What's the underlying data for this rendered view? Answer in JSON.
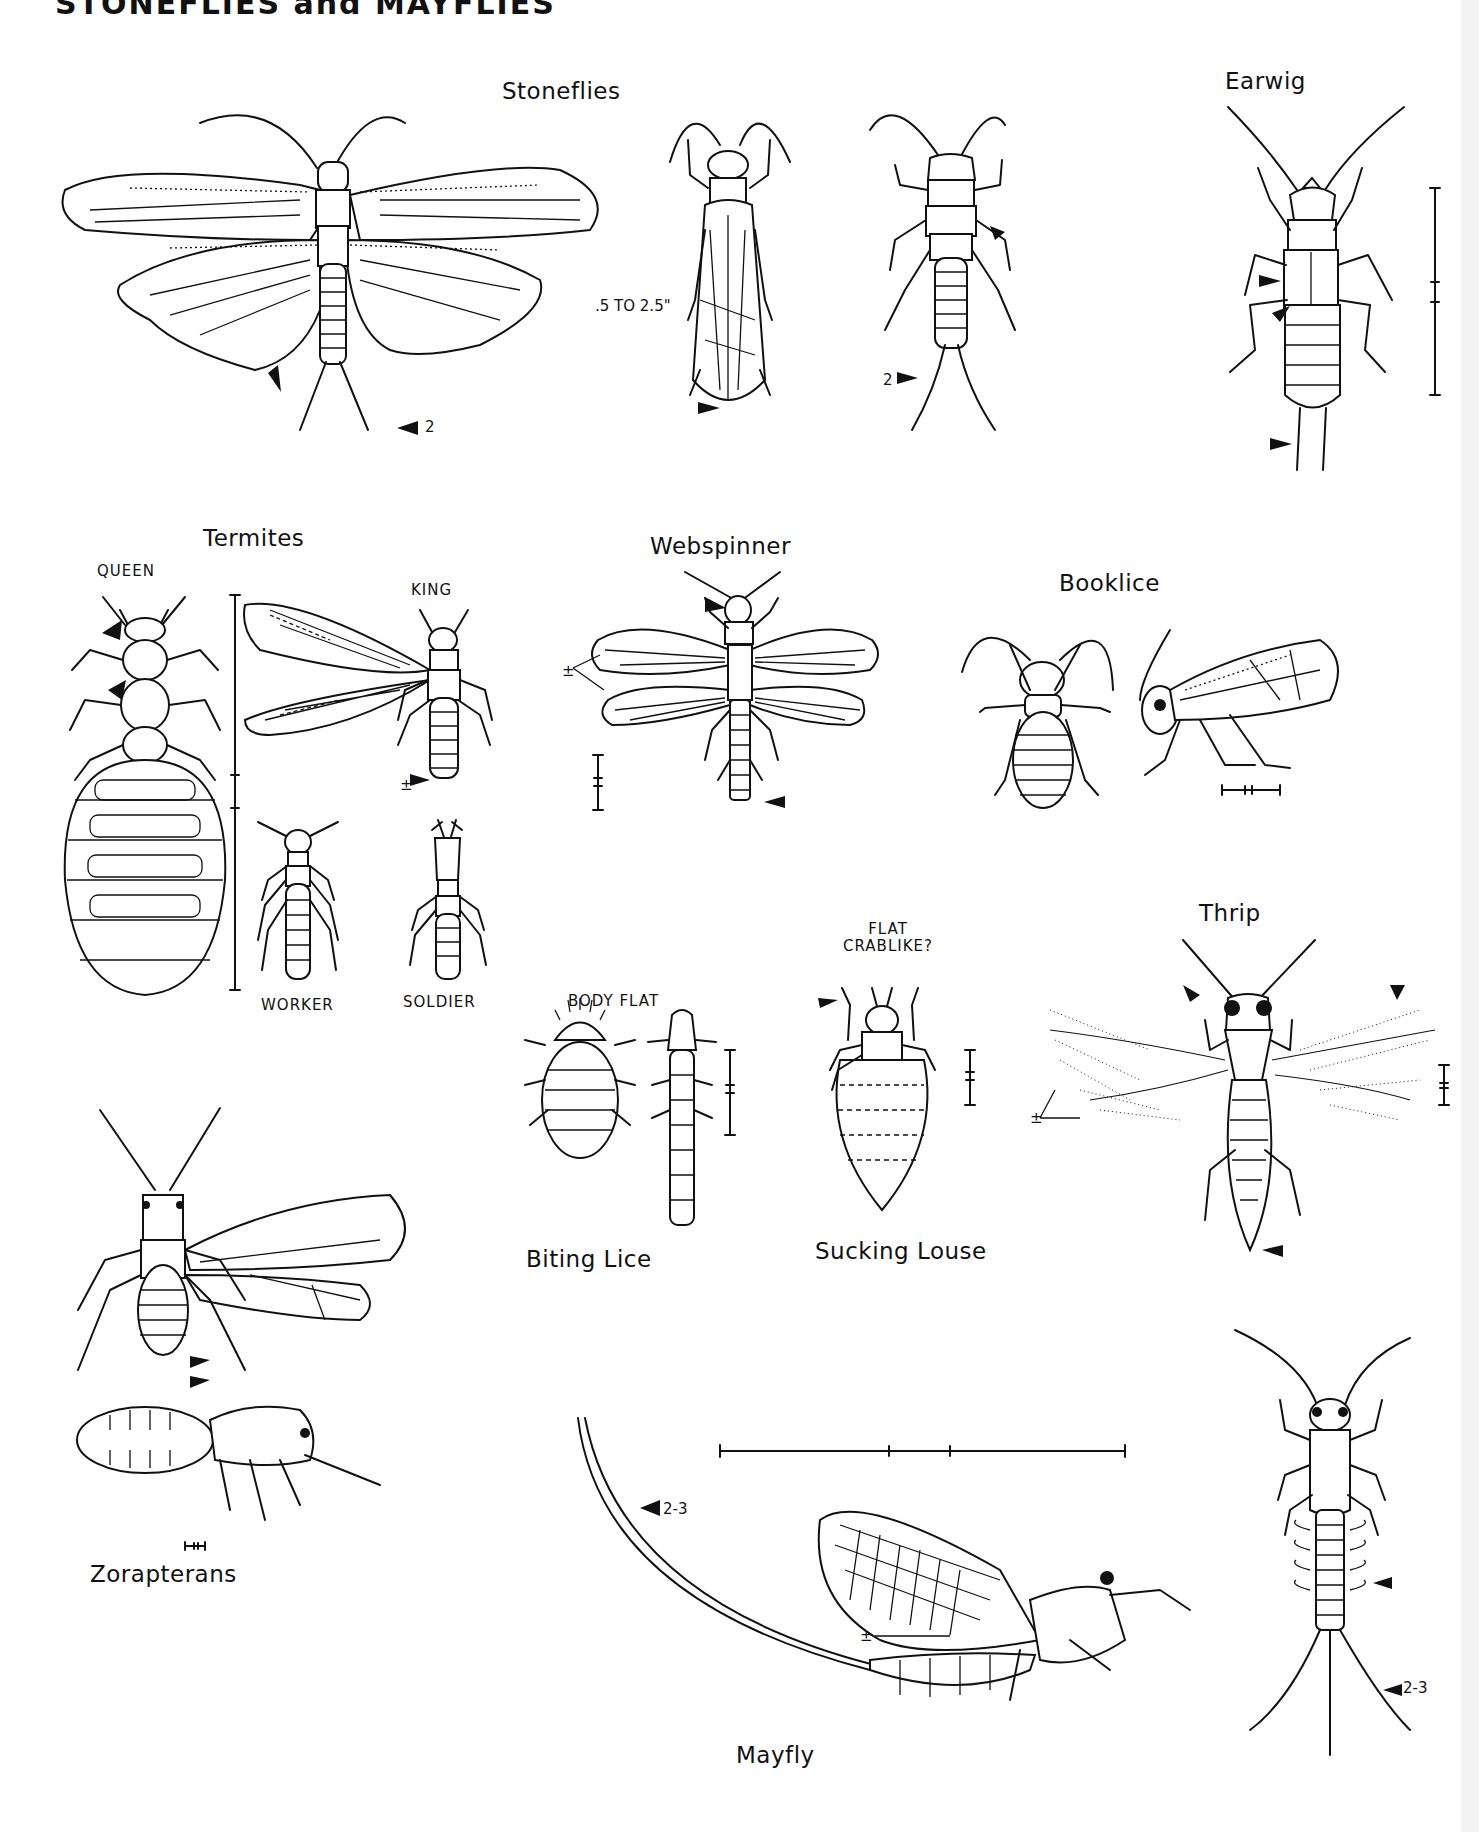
{
  "page": {
    "title": "STONEFLIES and MAYFLIES",
    "background": "#ffffff",
    "ink_color": "#111111"
  },
  "sections": {
    "stoneflies": {
      "label": "Stoneflies",
      "size_note": ".5 TO 2.5\"",
      "marker_count_1": "2",
      "marker_count_2": "2"
    },
    "earwig": {
      "label": "Earwig"
    },
    "termites": {
      "label": "Termites",
      "queen": "QUEEN",
      "king": "KING",
      "worker": "WORKER",
      "soldier": "SOLDIER",
      "plus_minus": "±"
    },
    "webspinner": {
      "label": "Webspinner",
      "plus_minus": "±"
    },
    "booklice": {
      "label": "Booklice"
    },
    "thrip": {
      "label": "Thrip",
      "plus_minus": "±"
    },
    "biting_lice": {
      "label": "Biting Lice",
      "note": "BODY FLAT"
    },
    "sucking_louse": {
      "label": "Sucking Louse",
      "note_line1": "FLAT",
      "note_line2": "CRABLIKE?"
    },
    "zorapterans": {
      "label": "Zorapterans"
    },
    "mayfly": {
      "label": "Mayfly",
      "marker_count_1": "2-3",
      "marker_count_2": "2-3",
      "plus_minus": "±"
    }
  }
}
